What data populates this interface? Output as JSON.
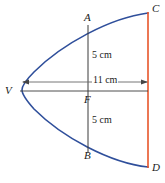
{
  "figure": {
    "type": "geometry-diagram",
    "colors": {
      "curve": "#2f4f9b",
      "chord_cd": "#e8552a",
      "line_ab": "#3a3a3a",
      "dimension_line": "#555555",
      "axis_line": "#3a3a3a",
      "label_text": "#1a1a1a",
      "background": "#ffffff"
    },
    "points": [
      {
        "id": "A",
        "label": "A",
        "x": 84,
        "y": 18
      },
      {
        "id": "B",
        "label": "B",
        "x": 84,
        "y": 155
      },
      {
        "id": "C",
        "label": "C",
        "x": 151,
        "y": 8
      },
      {
        "id": "D",
        "label": "D",
        "x": 151,
        "y": 166
      },
      {
        "id": "V",
        "label": "V",
        "x": 6,
        "y": 86
      },
      {
        "id": "F",
        "label": "F",
        "x": 84,
        "y": 96
      }
    ],
    "dimensions": [
      {
        "id": "upper-5cm",
        "label": "5 cm",
        "x": 91,
        "y": 51
      },
      {
        "id": "eleven-cm",
        "label": "11 cm",
        "x": 92,
        "y": 75
      },
      {
        "id": "lower-5cm",
        "label": "5 cm",
        "x": 91,
        "y": 116
      }
    ],
    "geometry": {
      "vertex": {
        "x": 22,
        "y": 90
      },
      "chord_ab": {
        "x": 88,
        "y_top": 26,
        "y_bottom": 152
      },
      "chord_cd": {
        "x": 148,
        "y_top": 13,
        "y_bottom": 167
      },
      "axis": {
        "x_start": 22,
        "x_end": 148,
        "y": 91
      },
      "dimension_line": {
        "x_start": 23,
        "x_end": 147,
        "y": 82
      }
    }
  }
}
